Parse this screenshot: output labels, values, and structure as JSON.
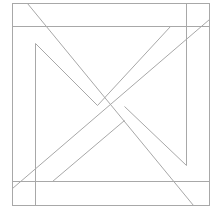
{
  "diagram": {
    "stroke_color": "#a8a8a8",
    "background": "#ffffff",
    "outer_square": {
      "x1": 12,
      "y1": 3,
      "x2": 209,
      "y2": 205
    },
    "lines": [
      {
        "name": "top-band-line",
        "x1": 12,
        "y1": 26,
        "x2": 209,
        "y2": 26
      },
      {
        "name": "right-band-line",
        "x1": 186,
        "y1": 3,
        "x2": 186,
        "y2": 165
      },
      {
        "name": "bottom-band-line",
        "x1": 12,
        "y1": 181,
        "x2": 209,
        "y2": 181
      },
      {
        "name": "left-band-line",
        "x1": 35,
        "y1": 43,
        "x2": 35,
        "y2": 205
      },
      {
        "name": "main-diagonal-descending",
        "x1": 27,
        "y1": 3,
        "x2": 193,
        "y2": 205
      },
      {
        "name": "main-diagonal-ascending",
        "x1": 12,
        "y1": 188,
        "x2": 209,
        "y2": 19
      },
      {
        "name": "inner-left-diagonal",
        "x1": 35,
        "y1": 43,
        "x2": 97,
        "y2": 105
      },
      {
        "name": "inner-top-diagonal",
        "x1": 170,
        "y1": 26,
        "x2": 97,
        "y2": 105
      },
      {
        "name": "inner-bottom-diagonal",
        "x1": 52,
        "y1": 181,
        "x2": 124,
        "y2": 120
      },
      {
        "name": "inner-right-diagonal",
        "x1": 186,
        "y1": 165,
        "x2": 124,
        "y2": 106
      }
    ]
  }
}
